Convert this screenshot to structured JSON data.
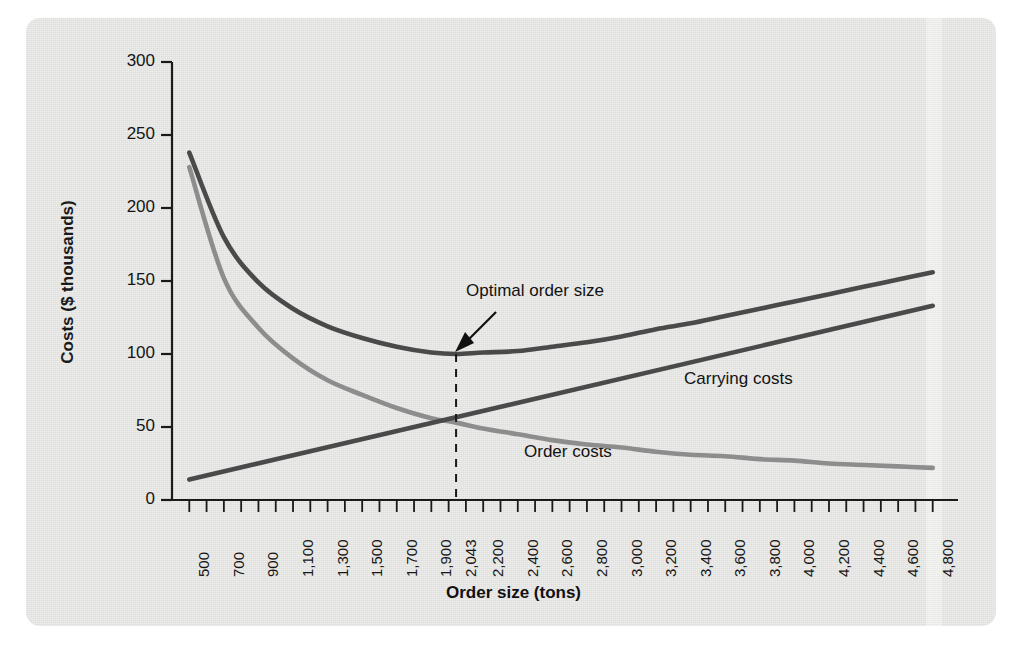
{
  "chart_data": {
    "type": "line",
    "title": "",
    "xlabel": "Order size (tons)",
    "ylabel": "Costs ($ thousands)",
    "xlim": [
      400,
      4900
    ],
    "ylim": [
      0,
      300
    ],
    "grid": false,
    "legend_position": "inline-labels",
    "ytick_values": [
      0,
      50,
      100,
      150,
      200,
      250,
      300
    ],
    "ytick_labels": [
      "0",
      "50",
      "100",
      "150",
      "200",
      "250",
      "300"
    ],
    "xtick_labels": [
      "500",
      "700",
      "900",
      "1,100",
      "1,300",
      "1,500",
      "1,700",
      "1,900",
      "2,043",
      "2,200",
      "2,400",
      "2,600",
      "2,800",
      "3,000",
      "3,200",
      "3,400",
      "3,600",
      "3,800",
      "4,000",
      "4,200",
      "4,400",
      "4,600",
      "4,800"
    ],
    "xtick_values": [
      500,
      700,
      900,
      1100,
      1300,
      1500,
      1700,
      1900,
      2043,
      2200,
      2400,
      2600,
      2800,
      3000,
      3200,
      3400,
      3600,
      3800,
      4000,
      4200,
      4400,
      4600,
      4800
    ],
    "minor_tick_step": 100,
    "annotations": [
      {
        "text": "Optimal order size",
        "x": 2043,
        "y": 100,
        "kind": "arrow-callout"
      }
    ],
    "optimal_order_size": 2043,
    "optimal_total_cost": 100,
    "series": [
      {
        "name": "Total costs",
        "color": "#4a4a4a",
        "label_shown": false,
        "x": [
          500,
          700,
          900,
          1100,
          1300,
          1500,
          1700,
          1900,
          2043,
          2200,
          2400,
          2600,
          2800,
          3000,
          3200,
          3400,
          3600,
          3800,
          4000,
          4200,
          4400,
          4600,
          4800
        ],
        "y": [
          238,
          180,
          149,
          131,
          119,
          111,
          105,
          101,
          100,
          101,
          102,
          105,
          108,
          112,
          117,
          121,
          126,
          131,
          136,
          141,
          146,
          151,
          156
        ]
      },
      {
        "name": "Order costs",
        "color": "#8d8d8d",
        "label_shown": true,
        "label_text": "Order costs",
        "x": [
          500,
          700,
          900,
          1100,
          1300,
          1500,
          1700,
          1900,
          2043,
          2200,
          2400,
          2600,
          2800,
          3000,
          3200,
          3400,
          3600,
          3800,
          4000,
          4200,
          4400,
          4600,
          4800
        ],
        "y": [
          228,
          152,
          118,
          97,
          82,
          72,
          63,
          56,
          53,
          49,
          45,
          41,
          38,
          36,
          33,
          31,
          30,
          28,
          27,
          25,
          24,
          23,
          22
        ]
      },
      {
        "name": "Carrying costs",
        "color": "#4a4a4a",
        "label_shown": true,
        "label_text": "Carrying costs",
        "x": [
          500,
          4800
        ],
        "y": [
          14,
          133
        ]
      }
    ]
  },
  "figure": {
    "y_axis_label": "Costs ($ thousands)",
    "x_axis_label": "Order size (tons)",
    "optimal_label": "Optimal order size",
    "carrying_label": "Carrying costs",
    "order_label": "Order costs",
    "panel_color": "#e3e3e1",
    "axis_color": "#1a1a1a",
    "total_curve_color": "#4a4a4a",
    "order_curve_color": "#8d8d8d",
    "carrying_curve_color": "#4a4a4a"
  }
}
